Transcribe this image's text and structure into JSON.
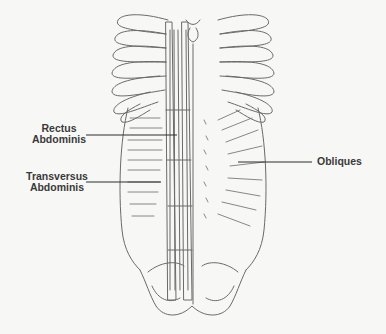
{
  "diagram": {
    "labels": [
      {
        "id": "rectus",
        "line1": "Rectus",
        "line2": "Abdominis"
      },
      {
        "id": "transversus",
        "line1": "Transversus",
        "line2": "Abdominis"
      },
      {
        "id": "obliques",
        "line1": "Obliques"
      }
    ],
    "colors": {
      "background": "#f7f7f5",
      "line_art": "#6a6a6a",
      "leader_lines": "#2e2e2e",
      "label_text": "#3a3a3a"
    }
  }
}
